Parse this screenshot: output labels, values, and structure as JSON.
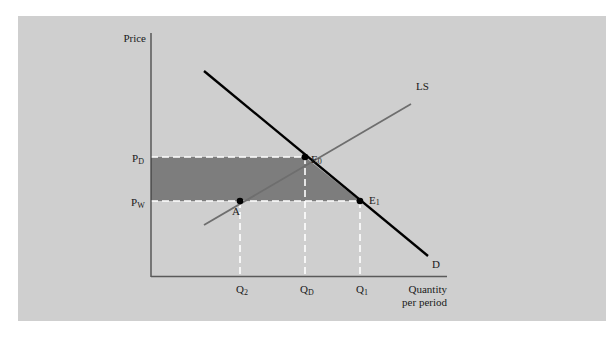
{
  "diagram": {
    "type": "economics-supply-demand",
    "axes": {
      "y_label": "Price",
      "x_label_line1": "Quantity",
      "x_label_line2": "per period"
    },
    "price_levels": [
      {
        "id": "PD",
        "main": "P",
        "sub": "D"
      },
      {
        "id": "PW",
        "main": "P",
        "sub": "W"
      }
    ],
    "quantity_levels": [
      {
        "id": "Q2",
        "main": "Q",
        "sub": "2"
      },
      {
        "id": "QD",
        "main": "Q",
        "sub": "D"
      },
      {
        "id": "Q1",
        "main": "Q",
        "sub": "1"
      }
    ],
    "curves": [
      {
        "id": "D",
        "label": "D",
        "color": "#000000"
      },
      {
        "id": "LS",
        "label": "LS",
        "color": "#6e6e6e"
      }
    ],
    "points": [
      {
        "id": "E0",
        "main": "E",
        "sub": "0"
      },
      {
        "id": "E1",
        "main": "E",
        "sub": "1"
      },
      {
        "id": "A",
        "main": "A",
        "sub": ""
      }
    ],
    "colors": {
      "panel": "#cfcfcf",
      "shaded_region": "#7d7d7d",
      "dashed_guides": "#ffffff",
      "axis": "#3a3a3a"
    }
  }
}
